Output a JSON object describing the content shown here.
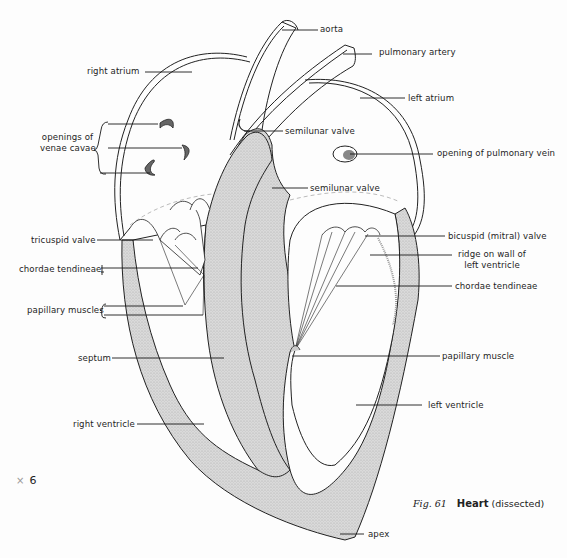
{
  "figure": {
    "number_label": "Fig. 61",
    "title": "Heart",
    "subtitle": "(dissected)",
    "magnification_symbol": "×",
    "magnification_value": "6"
  },
  "colors": {
    "ink": "#1e1e1e",
    "stipple_fill": "#d6d6d6",
    "background": "#fdfdfd"
  },
  "labels": {
    "aorta": "aorta",
    "pulmonary_artery": "pulmonary artery",
    "right_atrium": "right atrium",
    "left_atrium": "left atrium",
    "openings_venae_cavae_line1": "openings of",
    "openings_venae_cavae_line2": "venae cavae",
    "semilunar_valve_upper": "semilunar valve",
    "semilunar_valve_lower": "semilunar valve",
    "opening_pulmonary_vein": "opening of pulmonary vein",
    "tricuspid_valve": "tricuspid valve",
    "bicuspid_valve": "bicuspid (mitral) valve",
    "ridge_line1": "ridge on wall of",
    "ridge_line2": "left ventricle",
    "chordae_tendineae_left": "chordae tendineae",
    "chordae_tendineae_right": "chordae tendineae",
    "papillary_muscles": "papillary muscles",
    "papillary_muscle": "papillary muscle",
    "septum": "septum",
    "right_ventricle": "right ventricle",
    "left_ventricle": "left ventricle",
    "apex": "apex"
  }
}
